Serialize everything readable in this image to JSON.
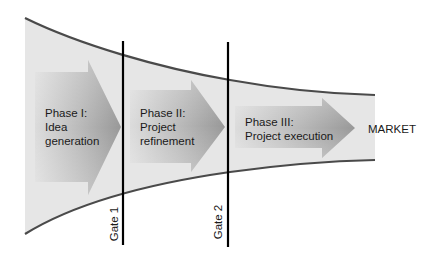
{
  "diagram": {
    "type": "stage-gate funnel",
    "phases": [
      {
        "id": "phase1",
        "line1": "Phase I:",
        "line2": "Idea",
        "line3": "generation"
      },
      {
        "id": "phase2",
        "line1": "Phase II:",
        "line2": "Project",
        "line3": "refinement"
      },
      {
        "id": "phase3",
        "line1": "Phase III:",
        "line2": "Project execution"
      }
    ],
    "gates": [
      {
        "id": "gate1",
        "label": "Gate 1"
      },
      {
        "id": "gate2",
        "label": "Gate 2"
      }
    ],
    "outcome": "MARKET",
    "colors": {
      "funnel_fill": "#e6e6e6",
      "funnel_edge": "#4a4a4a",
      "arrow_light": "#d4d4d4",
      "arrow_dark": "#9a9a9a",
      "gate_line": "#000000",
      "text": "#1a1a1a"
    }
  }
}
